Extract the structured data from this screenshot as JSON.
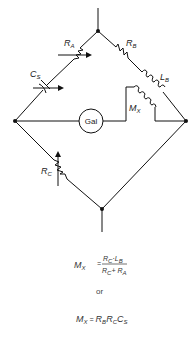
{
  "diagram": {
    "components": {
      "ra": {
        "label": "R",
        "sub": "A"
      },
      "rb": {
        "label": "R",
        "sub": "B"
      },
      "rc": {
        "label": "R",
        "sub": "C"
      },
      "cs": {
        "label": "C",
        "sub": "S"
      },
      "lb": {
        "label": "L",
        "sub": "B"
      },
      "mx": {
        "label": "M",
        "sub": "X"
      },
      "galvanometer": {
        "label": "Gal"
      }
    },
    "equations": {
      "eq1": {
        "lhs": "M",
        "lhs_sub": "X",
        "equals": "=",
        "numerator": "R",
        "numerator_sub": "C",
        "numerator_mid": "·L",
        "numerator_sub2": "B",
        "denominator": "R",
        "denominator_sub": "C",
        "denominator_mid": "+ R",
        "denominator_sub2": "A"
      },
      "connector": "or",
      "eq2": {
        "lhs": "M",
        "lhs_sub": "X",
        "equals": "=",
        "t1": "R",
        "t1_sub": "B",
        "t2": "R",
        "t2_sub": "C",
        "t3": "C",
        "t3_sub": "S"
      }
    }
  }
}
